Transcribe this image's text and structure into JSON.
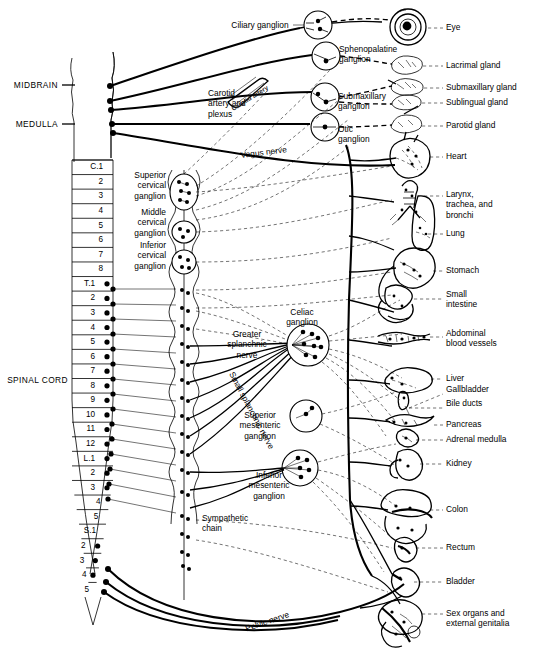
{
  "figure": {
    "colors": {
      "ink": "#000000",
      "paper": "#ffffff"
    }
  },
  "left_labels": {
    "midbrain": "MIDBRAIN",
    "medulla": "MEDULLA",
    "spinal_cord": "SPINAL CORD"
  },
  "cord_segments": [
    {
      "label": "C.1",
      "dot": false
    },
    {
      "label": "2",
      "dot": false
    },
    {
      "label": "3",
      "dot": false
    },
    {
      "label": "4",
      "dot": false
    },
    {
      "label": "5",
      "dot": false
    },
    {
      "label": "6",
      "dot": false
    },
    {
      "label": "7",
      "dot": false
    },
    {
      "label": "8",
      "dot": false
    },
    {
      "label": "T.1",
      "dot": true
    },
    {
      "label": "2",
      "dot": true
    },
    {
      "label": "3",
      "dot": true
    },
    {
      "label": "4",
      "dot": true
    },
    {
      "label": "5",
      "dot": true
    },
    {
      "label": "6",
      "dot": true
    },
    {
      "label": "7",
      "dot": true
    },
    {
      "label": "8",
      "dot": true
    },
    {
      "label": "9",
      "dot": true
    },
    {
      "label": "10",
      "dot": true
    },
    {
      "label": "11",
      "dot": true
    },
    {
      "label": "12",
      "dot": true
    },
    {
      "label": "L.1",
      "dot": true
    },
    {
      "label": "2",
      "dot": true
    },
    {
      "label": "3",
      "dot": true
    },
    {
      "label": "4",
      "dot": false
    },
    {
      "label": "5",
      "dot": false
    },
    {
      "label": "S.1",
      "dot": false
    },
    {
      "label": "2",
      "dot": true
    },
    {
      "label": "3",
      "dot": true
    },
    {
      "label": "4",
      "dot": true
    },
    {
      "label": "5",
      "dot": false
    }
  ],
  "ganglia_labels": {
    "ciliary": "Ciliary ganglion",
    "sphenopalatine": "Sphenopalatine\nganglion",
    "submaxillary": "Submaxillary\nganglion",
    "otic": "Otic\nganglion",
    "carotid": "Carotid\nartery and\nplexus",
    "carotid_overlay": "Carotid artery",
    "vagus": "Vagus nerve",
    "superior_cervical": "Superior\ncervical\nganglion",
    "middle_cervical": "Middle\ncervical\nganglion",
    "inferior_cervical": "Inferior\ncervical\nganglion",
    "celiac": "Celiac\nganglion",
    "greater_splanchnic": "Greater\nsplanchnic\nnerve",
    "small_splanchnic": "Small splanchnic nerve",
    "superior_mesenteric": "Superior\nmesenteric\nganglion",
    "inferior_mesenteric": "Inferior\nmesenteric\nganglion",
    "sympathetic_chain": "Sympathetic\nchain",
    "pelvic_nerve": "Pelvic nerve"
  },
  "organs": [
    {
      "name": "Eye",
      "label": "Eye"
    },
    {
      "name": "Lacrimal gland",
      "label": "Lacrimal gland"
    },
    {
      "name": "Submaxillary gland",
      "label": "Submaxillary gland"
    },
    {
      "name": "Sublingual gland",
      "label": "Sublingual gland"
    },
    {
      "name": "Parotid gland",
      "label": "Parotid gland"
    },
    {
      "name": "Heart",
      "label": "Heart"
    },
    {
      "name": "Larynx trachea bronchi",
      "label": "Larynx,\ntrachea, and\nbronchi"
    },
    {
      "name": "Lung",
      "label": "Lung"
    },
    {
      "name": "Stomach",
      "label": "Stomach"
    },
    {
      "name": "Small intestine",
      "label": "Small\nintestine"
    },
    {
      "name": "Abdominal blood vessels",
      "label": "Abdominal\nblood vessels"
    },
    {
      "name": "Liver",
      "label": "Liver"
    },
    {
      "name": "Gallbladder",
      "label": "Gallbladder"
    },
    {
      "name": "Bile ducts",
      "label": "Bile ducts"
    },
    {
      "name": "Pancreas",
      "label": "Pancreas"
    },
    {
      "name": "Adrenal medulla",
      "label": "Adrenal medulla"
    },
    {
      "name": "Kidney",
      "label": "Kidney"
    },
    {
      "name": "Colon",
      "label": "Colon"
    },
    {
      "name": "Rectum",
      "label": "Rectum"
    },
    {
      "name": "Bladder",
      "label": "Bladder"
    },
    {
      "name": "Sex organs and external genitalia",
      "label": "Sex organs and\nexternal genitalia"
    }
  ]
}
